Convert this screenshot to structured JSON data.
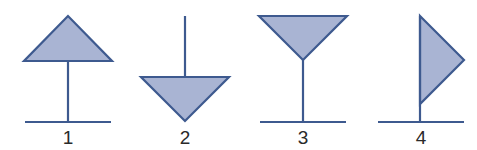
{
  "colors": {
    "stroke": "#3e5a8f",
    "fill": "#a9b4d3",
    "label": "#2a2a2a",
    "background": "#ffffff"
  },
  "figures": [
    {
      "label": "1",
      "shape": "triangle-up-on-stem"
    },
    {
      "label": "2",
      "shape": "triangle-down-hanging"
    },
    {
      "label": "3",
      "shape": "goblet-triangle-down-on-stem"
    },
    {
      "label": "4",
      "shape": "flag-triangle-right"
    }
  ]
}
